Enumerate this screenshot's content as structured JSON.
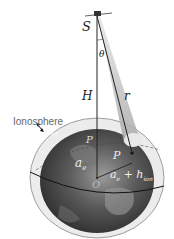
{
  "figure": {
    "labels": {
      "satellite": "S",
      "angle": "θ",
      "height": "H",
      "range": "r",
      "ionosphere": "Ionosphere",
      "shell_height": "h",
      "shell_height_sub": "ion",
      "pierce_point_outer": "P",
      "pierce_point_inner": "P",
      "earth_radius": "a",
      "earth_radius_sub": "e",
      "shell_radius": "a",
      "shell_radius_sub": "e",
      "shell_radius_plus": "+ h",
      "shell_radius_plus_sub": "ion",
      "origin": "O"
    },
    "colors": {
      "earth_dark": "#3a3a3a",
      "earth_light": "#8a8a8a",
      "shell": "#d9d9d9",
      "beam": "#bdbdbd",
      "lines": "#222222"
    }
  }
}
